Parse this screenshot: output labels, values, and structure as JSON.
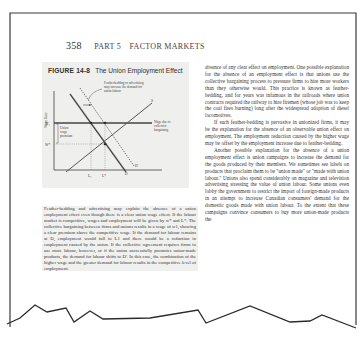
{
  "page": {
    "running_head": {
      "page_number": "358",
      "part": "PART 5",
      "section": "FACTOR MARKETS"
    }
  },
  "figure": {
    "label": "FIGURE 14-8",
    "title": "The Union Employment Effect",
    "annotation": "Featherbedding or advertising may increase the demand for union labour",
    "wage_label_right": "Wage due to collective bargaining",
    "premium_label": "Union wage premium",
    "y_axis_label": "Wage Rate",
    "y_ticks": [
      "W₁",
      "W*"
    ],
    "x_ticks": [
      "L₁",
      "L*"
    ],
    "curve_labels": {
      "supply": "S",
      "demand": "D",
      "demand_shifted": "D'"
    }
  },
  "caption": "Feather-bedding and advertising may explain the absence of a union employment effect even though there is a clear union wage effect. If the labour market is competitive, wages and employment will be given by w* and L*. The collective bargaining between firms and unions results in a wage of w1, showing a clear premium above the competitive wage. If the demand for labour remains at D, employment would fall to L1 and there would be a reduction in employment caused by the union. If the collective agreement requires firms to use more labour, however, or if the union successfully promotes union-made products, the demand for labour shifts to D'. In this case, the combination of the higher wage and the greater demand for labour results in the competitive level of employment.",
  "body": {
    "paragraphs": [
      "absence of any clear effect on employment. One possible explanation for the absence of an employment effect is that unions use the collective bargaining process to pressure firms to hire more workers than they otherwise would. This practice is known as feather-bedding, and for years was infamous in the railroads where union contracts required the railway to hire firemen (whose job was to keep the coal fires burning) long after the widespread adoption of diesel locomotives.",
      "If such feather-bedding is pervasive in unionized firms, it may be the explanation for the absence of an observable union effect on employment. The employment reduction caused by the higher wage may be offset by the employment increase due to feather-bedding.",
      "Another possible explanation for the absence of a union employment effect is union campaigns to increase the demand for the goods produced by their members. We sometimes see labels on products that proclaim them to be \"union made\" or \"made with union labour.\" Unions also spend considerably on magazine and television advertising stressing the value of union labour. Some unions even lobby the government to restrict the import of foreign-made products in an attempt to increase Canadian consumers' demand for the domestic goods made with union labour. To the extent that these campaigns convince consumers to buy more union-made products the"
    ]
  },
  "colors": {
    "border": "#3a3a3a",
    "figure_bg": "#efefed",
    "text": "#333333"
  }
}
